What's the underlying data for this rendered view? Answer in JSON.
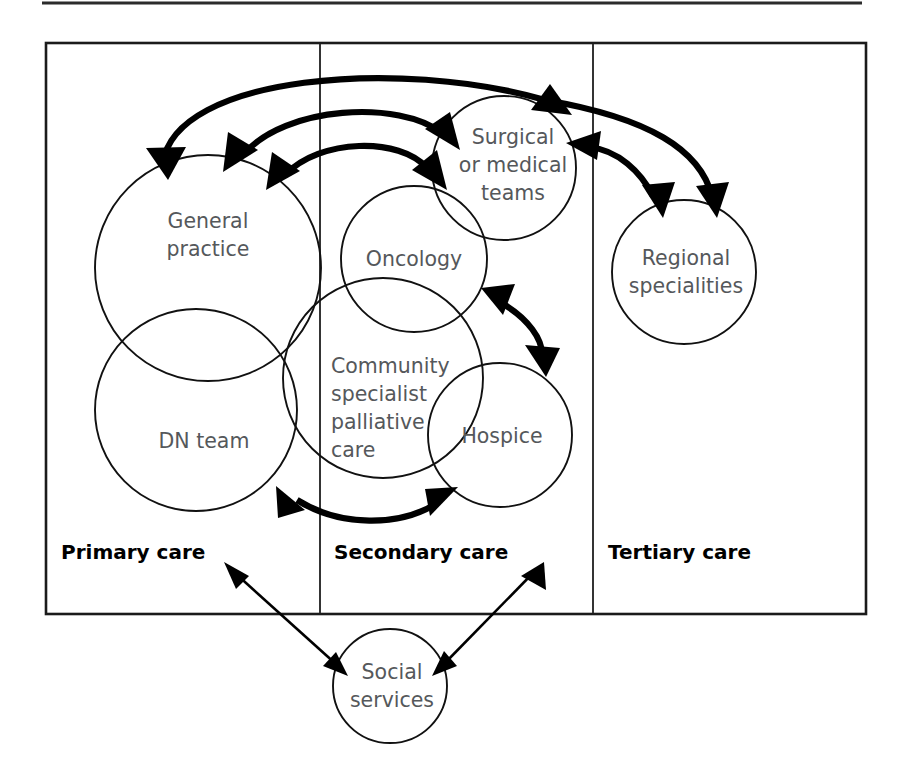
{
  "figure": {
    "title_rule": "horizontal-rule",
    "tiers": [
      {
        "id": "primary",
        "label": "Primary care"
      },
      {
        "id": "secondary",
        "label": "Secondary care"
      },
      {
        "id": "tertiary",
        "label": "Tertiary care"
      }
    ],
    "nodes": [
      {
        "id": "general-practice",
        "label_lines": [
          "General",
          "practice"
        ],
        "tier": "primary"
      },
      {
        "id": "dn-team",
        "label_lines": [
          "DN team"
        ],
        "tier": "primary"
      },
      {
        "id": "community-specialist-palliative-care",
        "label_lines": [
          "Community",
          "specialist",
          "palliative",
          "care"
        ],
        "tier": "secondary"
      },
      {
        "id": "oncology",
        "label_lines": [
          "Oncology"
        ],
        "tier": "secondary"
      },
      {
        "id": "surgical-or-medical-teams",
        "label_lines": [
          "Surgical",
          "or medical",
          "teams"
        ],
        "tier": "secondary"
      },
      {
        "id": "hospice",
        "label_lines": [
          "Hospice"
        ],
        "tier": "secondary"
      },
      {
        "id": "regional-specialities",
        "label_lines": [
          "Regional",
          "specialities"
        ],
        "tier": "tertiary"
      },
      {
        "id": "social-services",
        "label_lines": [
          "Social",
          "services"
        ],
        "tier": "outside"
      }
    ],
    "connections": [
      {
        "from": "general-practice",
        "to": "surgical-or-medical-teams",
        "style": "thick",
        "bidirectional": true
      },
      {
        "from": "general-practice",
        "to": "oncology",
        "style": "thick",
        "bidirectional": true
      },
      {
        "from": "general-practice",
        "to": "community-specialist-palliative-care",
        "style": "thick",
        "bidirectional": true
      },
      {
        "from": "surgical-or-medical-teams",
        "to": "regional-specialities",
        "style": "thick",
        "bidirectional": true
      },
      {
        "from": "oncology",
        "to": "hospice",
        "style": "thick",
        "bidirectional": true
      },
      {
        "from": "dn-team",
        "to": "hospice",
        "style": "thick",
        "bidirectional": true
      },
      {
        "from": "primary-care-tier",
        "to": "social-services",
        "style": "thin",
        "bidirectional": true
      },
      {
        "from": "secondary-care-tier",
        "to": "social-services",
        "style": "thin",
        "bidirectional": true
      }
    ],
    "colors": {
      "circle_stroke": "#111111",
      "node_text": "#55585b",
      "tier_text": "#000000",
      "frame": "#1b1b1b",
      "arrow": "#000000",
      "background": "#ffffff"
    }
  }
}
